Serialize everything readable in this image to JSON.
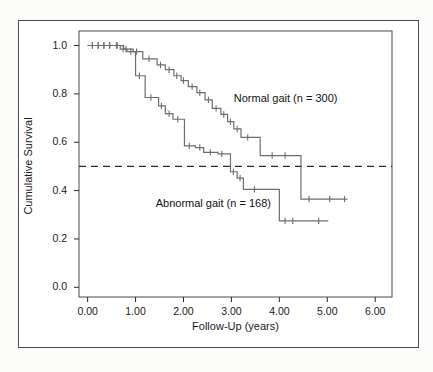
{
  "figure": {
    "background_color": "#ffffff",
    "page_color": "#fbfbfa",
    "frame_color": "#4a4a4a",
    "line_color": "#6e6e6e"
  },
  "chart_data": {
    "type": "line",
    "subtype": "kaplan-meier-step",
    "title": "",
    "xlabel": "Follow-Up (years)",
    "ylabel": "Cumulative Survival",
    "xlim": [
      -0.18,
      6.35
    ],
    "ylim": [
      -0.04,
      1.06
    ],
    "xticks": [
      0,
      1,
      2,
      3,
      4,
      5,
      6
    ],
    "xtick_labels": [
      "0.00",
      "1.00",
      "2.00",
      "3.00",
      "4.00",
      "5.00",
      "6.00"
    ],
    "yticks": [
      0.0,
      0.2,
      0.4,
      0.6,
      0.8,
      1.0
    ],
    "ytick_labels": [
      "0.0",
      "0.2",
      "0.4",
      "0.6",
      "0.8",
      "1.0"
    ],
    "grid": false,
    "legend_position": "inline-annotations",
    "reference_line": {
      "type": "horizontal-dashed",
      "y": 0.5,
      "label": "median survival level",
      "color": "#2b2b2b",
      "dash": "7,5"
    },
    "series": [
      {
        "name": "Normal gait (n = 300)",
        "n": 300,
        "color": "#6e6e6e",
        "annotation": "Normal gait (n = 300)",
        "annotation_x": 3.05,
        "annotation_y": 0.78,
        "steps": [
          [
            0.0,
            1.0
          ],
          [
            0.75,
            1.0
          ],
          [
            0.75,
            0.985
          ],
          [
            0.95,
            0.985
          ],
          [
            0.95,
            0.975
          ],
          [
            1.15,
            0.975
          ],
          [
            1.15,
            0.945
          ],
          [
            1.45,
            0.945
          ],
          [
            1.45,
            0.92
          ],
          [
            1.62,
            0.92
          ],
          [
            1.62,
            0.9
          ],
          [
            1.8,
            0.9
          ],
          [
            1.8,
            0.875
          ],
          [
            1.95,
            0.875
          ],
          [
            1.95,
            0.855
          ],
          [
            2.1,
            0.855
          ],
          [
            2.1,
            0.83
          ],
          [
            2.28,
            0.83
          ],
          [
            2.28,
            0.805
          ],
          [
            2.45,
            0.805
          ],
          [
            2.45,
            0.775
          ],
          [
            2.6,
            0.775
          ],
          [
            2.6,
            0.74
          ],
          [
            2.78,
            0.74
          ],
          [
            2.78,
            0.715
          ],
          [
            2.92,
            0.715
          ],
          [
            2.92,
            0.685
          ],
          [
            3.05,
            0.685
          ],
          [
            3.05,
            0.655
          ],
          [
            3.2,
            0.655
          ],
          [
            3.2,
            0.62
          ],
          [
            3.6,
            0.62
          ],
          [
            3.6,
            0.545
          ],
          [
            4.45,
            0.545
          ],
          [
            4.45,
            0.365
          ],
          [
            5.42,
            0.365
          ]
        ],
        "censor_marks": [
          [
            0.1,
            1.0
          ],
          [
            0.22,
            1.0
          ],
          [
            0.34,
            1.0
          ],
          [
            0.46,
            1.0
          ],
          [
            0.62,
            1.0
          ],
          [
            0.8,
            0.985
          ],
          [
            1.02,
            0.975
          ],
          [
            1.28,
            0.945
          ],
          [
            1.52,
            0.92
          ],
          [
            1.7,
            0.9
          ],
          [
            1.86,
            0.875
          ],
          [
            2.0,
            0.855
          ],
          [
            2.18,
            0.83
          ],
          [
            2.34,
            0.805
          ],
          [
            2.52,
            0.775
          ],
          [
            2.68,
            0.74
          ],
          [
            2.84,
            0.715
          ],
          [
            2.98,
            0.685
          ],
          [
            3.12,
            0.655
          ],
          [
            3.34,
            0.62
          ],
          [
            3.85,
            0.545
          ],
          [
            4.12,
            0.545
          ],
          [
            4.62,
            0.365
          ],
          [
            5.05,
            0.365
          ],
          [
            5.36,
            0.365
          ]
        ]
      },
      {
        "name": "Abnormal gait (n = 168)",
        "n": 168,
        "color": "#6e6e6e",
        "annotation": "Abnormal gait (n = 168)",
        "annotation_x": 1.42,
        "annotation_y": 0.345,
        "steps": [
          [
            0.0,
            1.0
          ],
          [
            0.68,
            1.0
          ],
          [
            0.68,
            0.985
          ],
          [
            0.82,
            0.985
          ],
          [
            0.82,
            0.975
          ],
          [
            1.0,
            0.975
          ],
          [
            1.0,
            0.875
          ],
          [
            1.2,
            0.875
          ],
          [
            1.2,
            0.785
          ],
          [
            1.48,
            0.785
          ],
          [
            1.48,
            0.75
          ],
          [
            1.62,
            0.75
          ],
          [
            1.62,
            0.718
          ],
          [
            1.78,
            0.718
          ],
          [
            1.78,
            0.695
          ],
          [
            2.02,
            0.695
          ],
          [
            2.02,
            0.585
          ],
          [
            2.25,
            0.585
          ],
          [
            2.25,
            0.578
          ],
          [
            2.42,
            0.578
          ],
          [
            2.42,
            0.558
          ],
          [
            2.72,
            0.558
          ],
          [
            2.72,
            0.552
          ],
          [
            2.98,
            0.552
          ],
          [
            2.98,
            0.478
          ],
          [
            3.12,
            0.478
          ],
          [
            3.12,
            0.452
          ],
          [
            3.25,
            0.452
          ],
          [
            3.25,
            0.405
          ],
          [
            4.0,
            0.405
          ],
          [
            4.0,
            0.275
          ],
          [
            5.02,
            0.275
          ]
        ],
        "censor_marks": [
          [
            0.1,
            1.0
          ],
          [
            0.22,
            1.0
          ],
          [
            0.34,
            1.0
          ],
          [
            0.46,
            1.0
          ],
          [
            0.6,
            1.0
          ],
          [
            0.74,
            0.985
          ],
          [
            0.9,
            0.975
          ],
          [
            1.08,
            0.875
          ],
          [
            1.32,
            0.785
          ],
          [
            1.54,
            0.75
          ],
          [
            1.7,
            0.718
          ],
          [
            1.88,
            0.695
          ],
          [
            2.12,
            0.585
          ],
          [
            2.34,
            0.578
          ],
          [
            2.56,
            0.558
          ],
          [
            2.8,
            0.552
          ],
          [
            3.04,
            0.478
          ],
          [
            3.18,
            0.452
          ],
          [
            3.48,
            0.405
          ],
          [
            4.12,
            0.275
          ],
          [
            4.28,
            0.275
          ],
          [
            4.82,
            0.275
          ]
        ]
      }
    ]
  }
}
